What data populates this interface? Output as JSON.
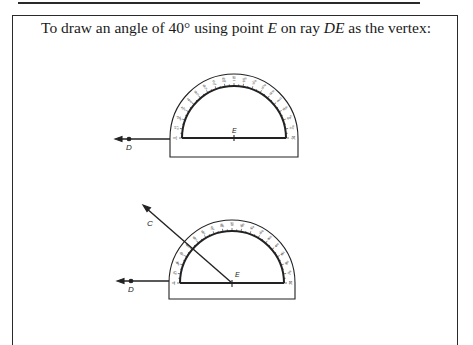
{
  "instruction": {
    "part1": "To draw an angle of 40° using point ",
    "point_vertex": "E",
    "part2": " on ray ",
    "ray_name": "DE",
    "part3": " as the vertex:"
  },
  "figure1": {
    "labels": {
      "D": "D",
      "E": "E"
    },
    "scale_outer": [
      "0",
      "10",
      "20",
      "30",
      "40",
      "50",
      "60",
      "70",
      "80",
      "90",
      "100",
      "110",
      "120",
      "130",
      "140",
      "150",
      "160",
      "170",
      "180"
    ],
    "scale_inner": [
      "180",
      "170",
      "160",
      "150",
      "140",
      "130",
      "120",
      "110",
      "100",
      "90",
      "80",
      "70",
      "60",
      "50",
      "40",
      "30",
      "20",
      "10",
      "0"
    ]
  },
  "figure2": {
    "labels": {
      "C": "C",
      "D": "D",
      "E": "E"
    },
    "angle_degrees": "40"
  },
  "colors": {
    "ink": "#1a1a1a",
    "paper": "#ffffff"
  }
}
